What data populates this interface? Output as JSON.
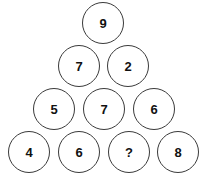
{
  "puzzle": {
    "type": "number-pyramid",
    "title": "Number pyramid puzzle",
    "unknown_marker": "?",
    "rows": [
      {
        "index": 0,
        "top": 2,
        "nodes": [
          {
            "value": "9",
            "left": 82,
            "is_unknown": false
          }
        ]
      },
      {
        "index": 1,
        "top": 45,
        "nodes": [
          {
            "value": "7",
            "left": 58,
            "is_unknown": false
          },
          {
            "value": "2",
            "left": 107,
            "is_unknown": false
          }
        ]
      },
      {
        "index": 2,
        "top": 88,
        "nodes": [
          {
            "value": "5",
            "left": 33,
            "is_unknown": false
          },
          {
            "value": "7",
            "left": 83,
            "is_unknown": false
          },
          {
            "value": "6",
            "left": 133,
            "is_unknown": false
          }
        ]
      },
      {
        "index": 3,
        "top": 131,
        "nodes": [
          {
            "value": "4",
            "left": 8,
            "is_unknown": false
          },
          {
            "value": "6",
            "left": 58,
            "is_unknown": false
          },
          {
            "value": "?",
            "left": 108,
            "is_unknown": true
          },
          {
            "value": "8",
            "left": 157,
            "is_unknown": false
          }
        ]
      }
    ]
  },
  "style": {
    "background": "#ffffff",
    "circle_stroke": "#3a3a3a",
    "circle_fill": "#ffffff",
    "text_color": "#111111"
  }
}
